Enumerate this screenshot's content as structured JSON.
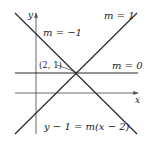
{
  "diagram": {
    "type": "line-family",
    "axes": {
      "x_label": "x",
      "y_label": "y"
    },
    "point": {
      "label": "(2, 1)",
      "x": 2,
      "y": 1
    },
    "lines": [
      {
        "slope_label": "m = 1",
        "slope": 1
      },
      {
        "slope_label": "m = −1",
        "slope": -1
      },
      {
        "slope_label": "m = 0",
        "slope": 0
      }
    ],
    "equation": "y − 1 = m(x − 2)",
    "colors": {
      "line": "#2a2a2a",
      "axis": "#555555",
      "text": "#222222",
      "background": "#ffffff"
    }
  }
}
